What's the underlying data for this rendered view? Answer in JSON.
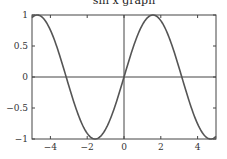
{
  "chart_data": {
    "type": "line",
    "title": "sin x graph",
    "xlabel": "",
    "ylabel": "",
    "xlim": [
      -5,
      5
    ],
    "ylim": [
      -1,
      1
    ],
    "xticks": [
      -4,
      -2,
      0,
      2,
      4
    ],
    "xtick_labels": [
      "−4",
      "−2",
      "0",
      "2",
      "4"
    ],
    "yticks": [
      -1,
      -0.5,
      0,
      0.5,
      1
    ],
    "ytick_labels": [
      "−1",
      "−0.5",
      "0",
      "0.5",
      "1"
    ],
    "grid": false,
    "series": [
      {
        "name": "sin(x)",
        "function": "sin(x)",
        "x": [
          -5,
          -4.71,
          -4,
          -3.14,
          -2,
          -1.57,
          -1,
          0,
          1,
          1.57,
          2,
          3.14,
          4,
          4.71,
          5
        ],
        "y": [
          0.96,
          1,
          0.76,
          0,
          -0.91,
          -1,
          -0.84,
          0,
          0.84,
          1,
          0.91,
          0,
          -0.76,
          -1,
          -0.96
        ],
        "color": "#555555"
      }
    ],
    "axis_lines": {
      "x0": true,
      "y0": true
    }
  }
}
